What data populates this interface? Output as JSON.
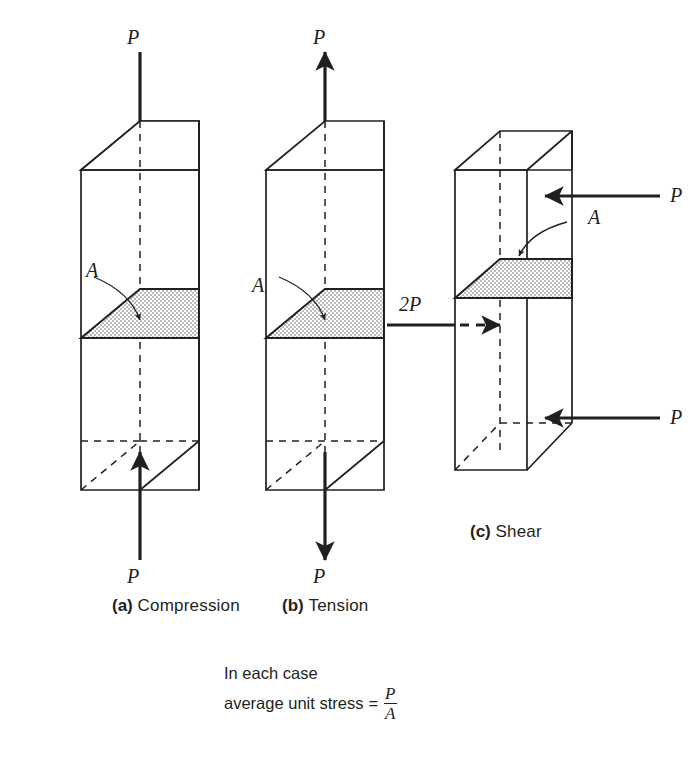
{
  "figure": {
    "panels": [
      {
        "id": "a",
        "tag": "(a)",
        "label": "Compression",
        "caption": "(a) Compression",
        "load_label_top": "P",
        "load_label_bottom": "P",
        "area_label": "A",
        "top_arrow_direction": "down",
        "bottom_arrow_direction": "up"
      },
      {
        "id": "b",
        "tag": "(b)",
        "label": "Tension",
        "caption": "(b) Tension",
        "load_label_top": "P",
        "load_label_bottom": "P",
        "area_label": "A",
        "top_arrow_direction": "up",
        "bottom_arrow_direction": "down"
      },
      {
        "id": "c",
        "tag": "(c)",
        "label": "Shear",
        "caption": "(c) Shear",
        "load_label_top_right": "P",
        "load_label_bottom_right": "P",
        "load_label_left": "2P",
        "area_label": "A",
        "top_arrow_direction": "left",
        "middle_arrow_direction": "right",
        "bottom_arrow_direction": "left"
      }
    ],
    "note": {
      "line1": "In each case",
      "line2_prefix": "average unit stress",
      "equals": "=",
      "fraction_numerator": "P",
      "fraction_denominator": "A"
    },
    "colors": {
      "ink": "#231f20",
      "background": "#ffffff",
      "stipple": "#6d6d6d"
    }
  }
}
